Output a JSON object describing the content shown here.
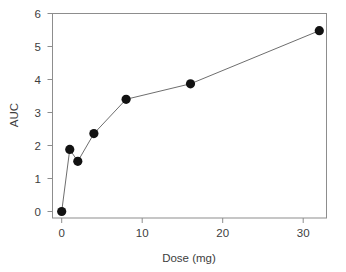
{
  "chart_data": {
    "type": "scatter",
    "title": "",
    "subtitle": "",
    "xlabel": "Dose (mg)",
    "ylabel": "AUC",
    "xlim": [
      -1.2,
      34.0
    ],
    "ylim": [
      -0.2,
      6.2
    ],
    "xticks": [
      0,
      10,
      20,
      30
    ],
    "xtick_labels": [
      "0",
      "10",
      "20",
      "30"
    ],
    "yticks": [
      0,
      1,
      2,
      3,
      4,
      5,
      6
    ],
    "ytick_labels": [
      "0",
      "1",
      "2",
      "3",
      "4",
      "5",
      "6"
    ],
    "grid": false,
    "legend": false,
    "legend_position": "none",
    "marker": "filled-circle",
    "marker_color": "#121212",
    "line_color": "#6e6e6e",
    "connected": true,
    "x": [
      0,
      1,
      2,
      4,
      8,
      16,
      32
    ],
    "y": [
      0.0,
      1.88,
      1.52,
      2.36,
      3.4,
      3.87,
      5.48
    ],
    "series": [
      {
        "name": "AUC",
        "points": [
          {
            "x": 0,
            "y": 0.0
          },
          {
            "x": 1,
            "y": 1.88
          },
          {
            "x": 2,
            "y": 1.52
          },
          {
            "x": 4,
            "y": 2.36
          },
          {
            "x": 8,
            "y": 3.4
          },
          {
            "x": 16,
            "y": 3.87
          },
          {
            "x": 32,
            "y": 5.48
          }
        ]
      }
    ]
  },
  "figure": {
    "background": "#ffffff",
    "frame_color": "#8d8d8d",
    "text_color": "#3d3d3d"
  }
}
